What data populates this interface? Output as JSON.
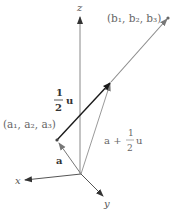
{
  "diagram": {
    "axes": {
      "x_label": "x",
      "y_label": "y",
      "z_label": "z"
    },
    "points": {
      "a_label": "(a₁, a₂, a₃)",
      "b_label": "(b₁, b₂, b₃)"
    },
    "vectors": {
      "a_label": "a",
      "half_u_numerator": "1",
      "half_u_denominator": "2",
      "half_u_symbol": "u",
      "sum_prefix": "a +",
      "sum_numerator": "1",
      "sum_denominator": "2",
      "sum_symbol": "u"
    },
    "colors": {
      "axis": "#777777",
      "black_vector": "#1a1a1a",
      "gray_vector": "#8a8a8a",
      "text": "#666666"
    }
  }
}
